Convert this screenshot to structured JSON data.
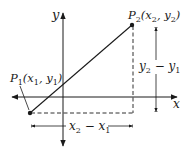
{
  "diagram": {
    "axes": {
      "x_label": "x",
      "y_label": "y"
    },
    "points": [
      {
        "name": "P1",
        "letter": "P",
        "index": "1",
        "coords_label": "(x",
        "coord_x_sub": "1",
        "comma": ", y",
        "coord_y_sub": "1",
        "close": ")"
      },
      {
        "name": "P2",
        "letter": "P",
        "index": "2",
        "coords_label": "(x",
        "coord_x_sub": "2",
        "comma": ", y",
        "coord_y_sub": "2",
        "close": ")"
      }
    ],
    "dimensions": {
      "horizontal": {
        "a": "x",
        "a_sub": "2",
        "op": " − ",
        "b": "x",
        "b_sub": "1"
      },
      "vertical": {
        "a": "y",
        "a_sub": "2",
        "op": " − ",
        "b": "y",
        "b_sub": "1"
      }
    },
    "colors": {
      "ink": "#1a1a1a",
      "background": "#ffffff"
    }
  }
}
